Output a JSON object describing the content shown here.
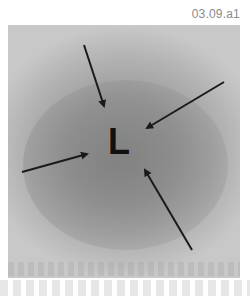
{
  "figure": {
    "id_label": "03.09.a1",
    "center_label": "L",
    "arrows": [
      {
        "name": "arrow-top",
        "from": [
          84,
          45
        ],
        "to": [
          104,
          106
        ]
      },
      {
        "name": "arrow-right",
        "from": [
          224,
          82
        ],
        "to": [
          147,
          128
        ]
      },
      {
        "name": "arrow-left",
        "from": [
          22,
          172
        ],
        "to": [
          87,
          154
        ]
      },
      {
        "name": "arrow-bottom",
        "from": [
          192,
          250
        ],
        "to": [
          145,
          170
        ]
      }
    ],
    "colors": {
      "arrow": "#1a1a1a",
      "label": "#111111",
      "id_text": "#8a8a8a"
    }
  }
}
